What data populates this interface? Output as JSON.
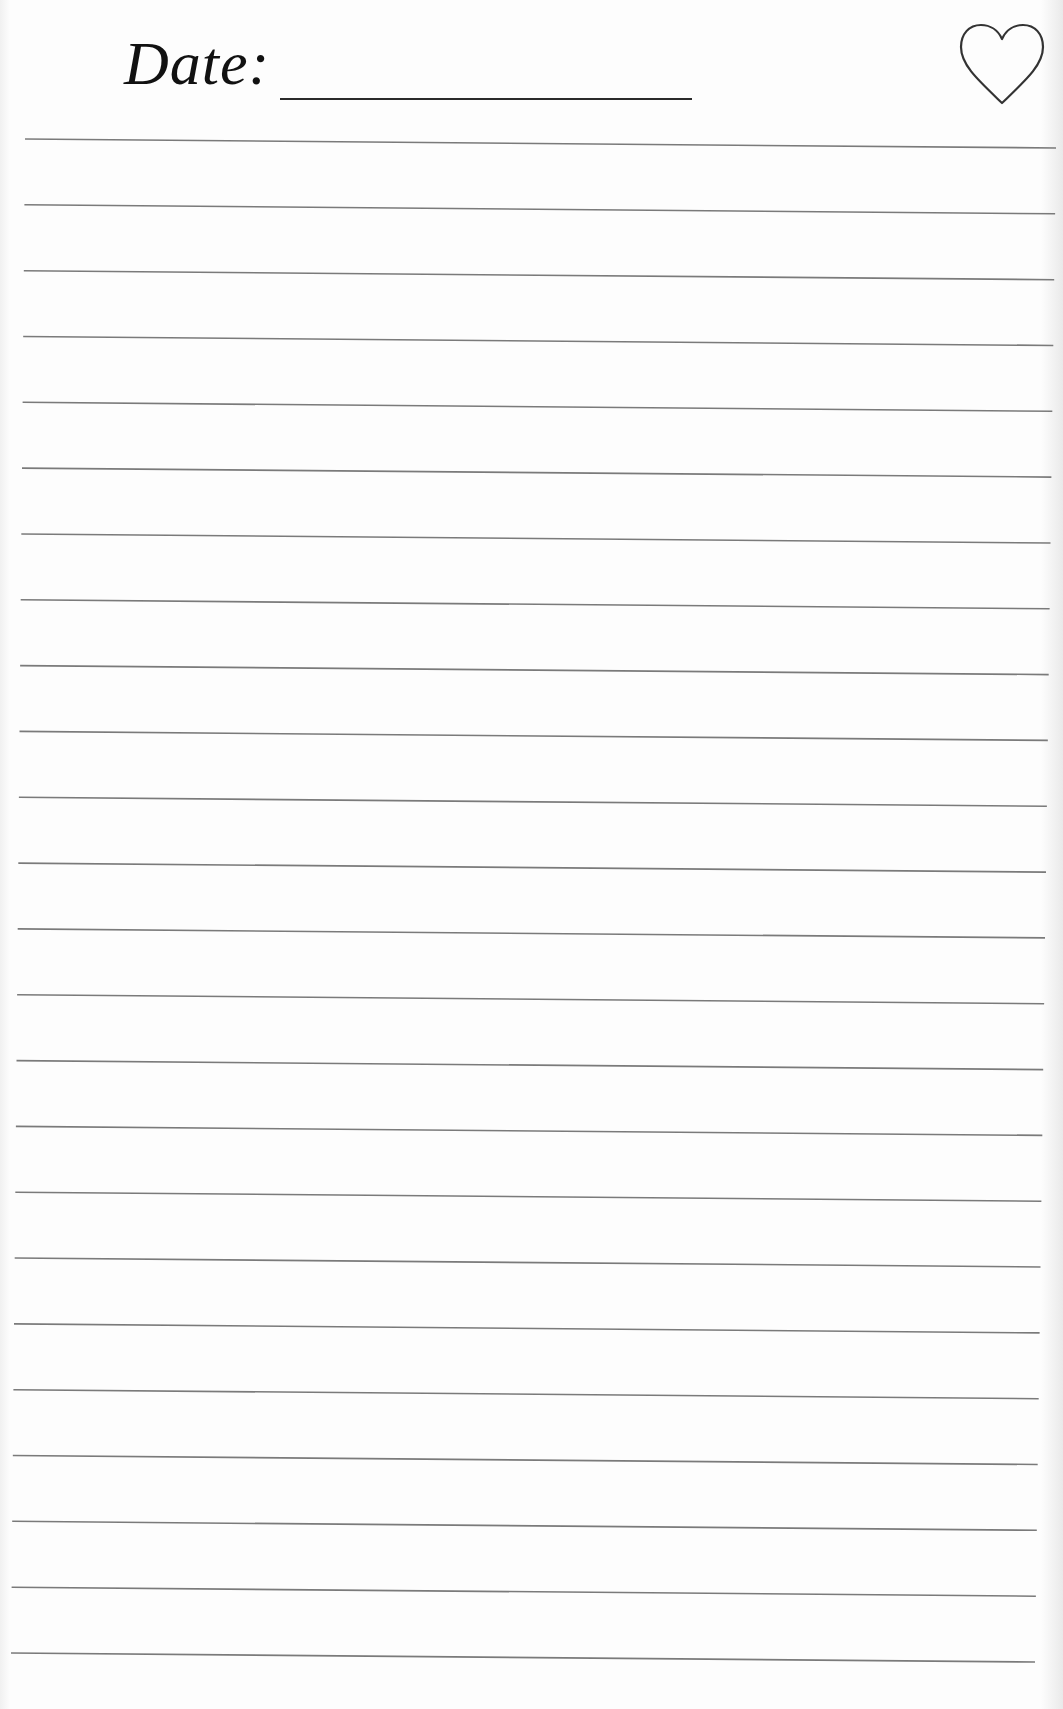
{
  "header": {
    "date_label": "Date:",
    "date_value": "",
    "favorite_icon": "heart-outline-icon"
  },
  "ruled_area": {
    "line_count": 24,
    "line_color": "#7a7a7a",
    "top_line": {
      "x1": 25,
      "y1": 139,
      "x2": 1056,
      "y2": 148
    },
    "bottom_line": {
      "x1": 11,
      "y1": 1653,
      "x2": 1035,
      "y2": 1662
    }
  },
  "colors": {
    "paper": "#fdfdfd",
    "ink": "#111111",
    "rule": "#7a7a7a",
    "heart_stroke": "#333333"
  }
}
